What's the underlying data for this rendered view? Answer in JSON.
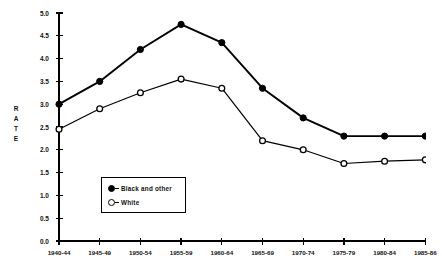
{
  "chart_data": {
    "type": "line",
    "title": "",
    "subtitle": "",
    "xlabel": "",
    "ylabel": "RATE",
    "categories": [
      "1940-44",
      "1945-49",
      "1950-54",
      "1955-59",
      "1960-64",
      "1965-69",
      "1970-74",
      "1975-79",
      "1980-84",
      "1985-86"
    ],
    "ylim": [
      0.0,
      5.0
    ],
    "ytick_labels": [
      "0.0",
      "0.5",
      "1.0",
      "1.5",
      "2.0",
      "2.5",
      "3.0",
      "3.5",
      "4.0",
      "4.5",
      "5.0"
    ],
    "ytick_values": [
      0.0,
      0.5,
      1.0,
      1.5,
      2.0,
      2.5,
      3.0,
      3.5,
      4.0,
      4.5,
      5.0
    ],
    "grid": false,
    "legend_position": "inside-lower-left",
    "series": [
      {
        "name": "Black and other",
        "marker": "filled-circle",
        "color": "#000000",
        "values": [
          3.0,
          3.5,
          4.2,
          4.75,
          4.35,
          3.35,
          2.7,
          2.3,
          2.3,
          2.3
        ]
      },
      {
        "name": "White",
        "marker": "open-circle",
        "color": "#000000",
        "values": [
          2.45,
          2.9,
          3.25,
          3.55,
          3.35,
          2.2,
          2.0,
          1.7,
          1.75,
          1.78
        ]
      }
    ]
  },
  "axis": {
    "y_title_letters": [
      "R",
      "A",
      "T",
      "E"
    ]
  },
  "legend": {
    "entries": [
      {
        "label": "Black and other",
        "marker": "filled-circle"
      },
      {
        "label": "White",
        "marker": "open-circle"
      }
    ]
  }
}
